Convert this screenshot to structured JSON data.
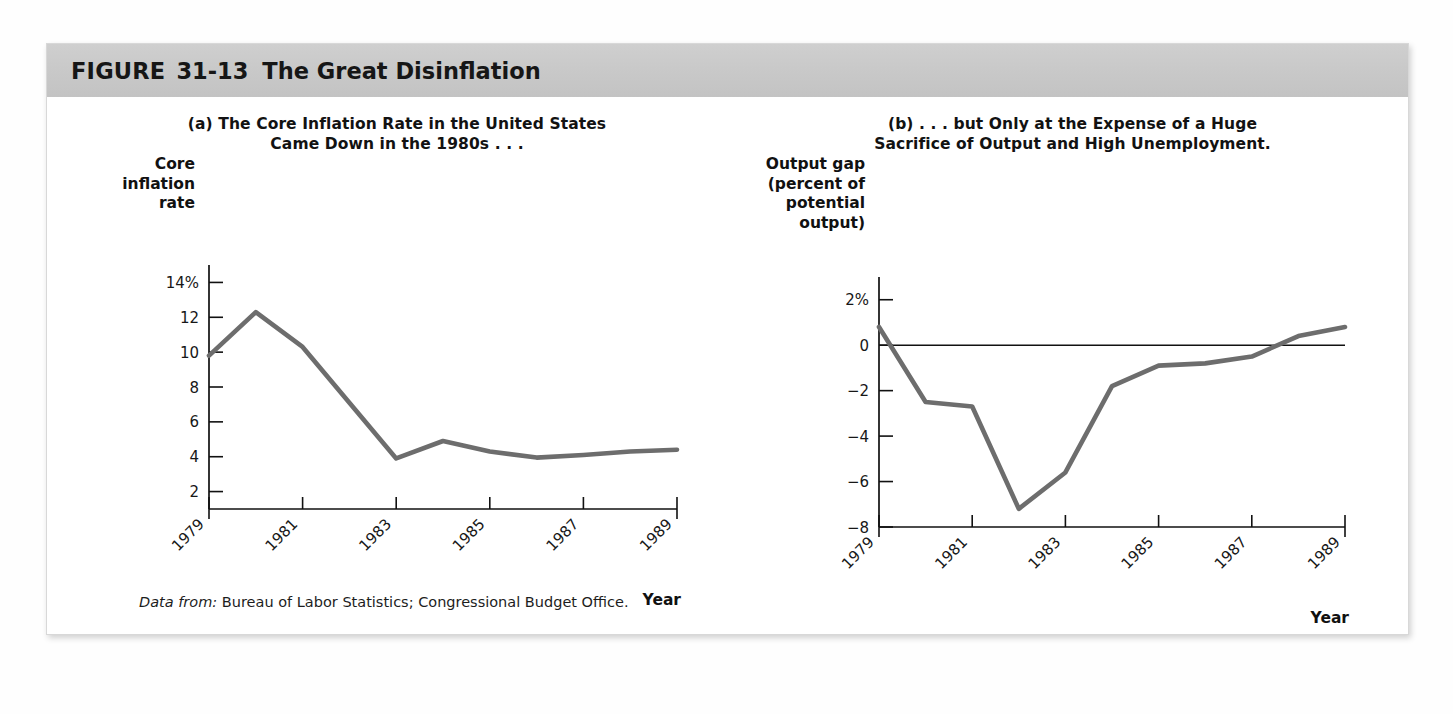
{
  "figure": {
    "label": "FIGURE",
    "number": "31-13",
    "title": "The Great Disinflation",
    "source_lead": "Data from:",
    "source_body": "Bureau of Labor Statistics; Congressional Budget Office.",
    "header_bg": "#c8c8c8",
    "line_color": "#6d6d6d",
    "axis_color": "#111111"
  },
  "chart_data": [
    {
      "type": "line",
      "panel": "a",
      "title_line1": "(a) The Core Inflation Rate in the United States",
      "title_line2": "Came Down in the 1980s . . .",
      "xlabel": "Year",
      "ylabel_lines": [
        "Core",
        "inflation",
        "rate"
      ],
      "x": [
        1979,
        1980,
        1981,
        1982,
        1983,
        1984,
        1985,
        1986,
        1987,
        1988,
        1989
      ],
      "values": [
        9.8,
        12.3,
        10.3,
        7.1,
        3.9,
        4.9,
        4.3,
        3.95,
        4.1,
        4.3,
        4.4
      ],
      "series_name": "Core inflation rate",
      "ylim": [
        1,
        15
      ],
      "yticks": [
        14,
        12,
        10,
        8,
        6,
        4,
        2
      ],
      "ytick_labels": [
        "14%",
        "12",
        "10",
        "8",
        "6",
        "4",
        "2"
      ],
      "xticks": [
        1979,
        1981,
        1983,
        1985,
        1987,
        1989
      ],
      "xtick_labels": [
        "1979",
        "1981",
        "1983",
        "1985",
        "1987",
        "1989"
      ],
      "xlim": [
        1979,
        1989
      ],
      "grid": false,
      "legend": "none",
      "zero_line": false
    },
    {
      "type": "line",
      "panel": "b",
      "title_line1": "(b) . . . but Only at the Expense of a Huge",
      "title_line2": "Sacrifice of Output and High Unemployment.",
      "xlabel": "Year",
      "ylabel_lines": [
        "Output gap",
        "(percent of",
        "potential",
        "output)"
      ],
      "x": [
        1979,
        1980,
        1981,
        1982,
        1983,
        1984,
        1985,
        1986,
        1987,
        1988,
        1989
      ],
      "values": [
        0.8,
        -2.5,
        -2.7,
        -7.2,
        -5.6,
        -1.8,
        -0.9,
        -0.8,
        -0.5,
        0.4,
        0.8
      ],
      "series_name": "Output gap",
      "ylim": [
        -8,
        3
      ],
      "yticks": [
        2,
        0,
        -2,
        -4,
        -6,
        -8
      ],
      "ytick_labels": [
        "2%",
        "0",
        "−2",
        "−4",
        "−6",
        "−8"
      ],
      "xticks": [
        1979,
        1981,
        1983,
        1985,
        1987,
        1989
      ],
      "xtick_labels": [
        "1979",
        "1981",
        "1983",
        "1985",
        "1987",
        "1989"
      ],
      "xlim": [
        1979,
        1989
      ],
      "grid": false,
      "legend": "none",
      "zero_line": true
    }
  ]
}
